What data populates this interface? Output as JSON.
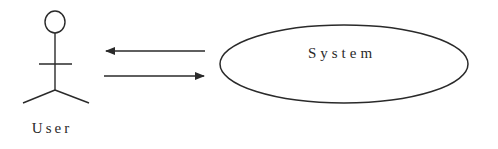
{
  "diagram": {
    "type": "use-case",
    "actor": {
      "label": "User",
      "icon": "stick-figure-icon"
    },
    "use_case": {
      "label": "System"
    },
    "arrows": [
      {
        "from": "System",
        "to": "User",
        "direction": "left"
      },
      {
        "from": "User",
        "to": "System",
        "direction": "right"
      }
    ],
    "colors": {
      "stroke": "#2a2a2a",
      "background": "#ffffff"
    }
  }
}
